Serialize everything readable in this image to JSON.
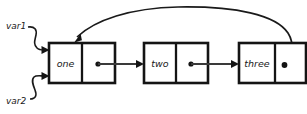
{
  "diagram": {
    "type": "linked-list",
    "background_color": "#ffffff",
    "ink_color": "#141414",
    "nodes": [
      {
        "id": "node-one",
        "label": "one",
        "data_cell": {
          "x": 49,
          "y": 43,
          "width": 33,
          "height": 40
        },
        "pointer_cell": {
          "x": 82,
          "y": 43,
          "width": 33,
          "height": 40
        },
        "pointer_dot": {
          "cx": 98,
          "cy": 64,
          "r": 2.6
        },
        "pointer_target": "node-two"
      },
      {
        "id": "node-two",
        "label": "two",
        "data_cell": {
          "x": 144,
          "y": 43,
          "width": 32,
          "height": 40
        },
        "pointer_cell": {
          "x": 176,
          "y": 43,
          "width": 32,
          "height": 40
        },
        "pointer_dot": {
          "cx": 191,
          "cy": 64,
          "r": 2.6
        },
        "pointer_target": "node-three"
      },
      {
        "id": "node-three",
        "label": "three",
        "data_cell": {
          "x": 239,
          "y": 43,
          "width": 36,
          "height": 40
        },
        "pointer_cell": {
          "x": 275,
          "y": 43,
          "width": 31,
          "height": 40
        },
        "pointer_dot": {
          "cx": 284,
          "cy": 66,
          "r": 2.8
        },
        "pointer_target": "node-one"
      }
    ],
    "variables": [
      {
        "id": "var1",
        "label": "var1",
        "label_x": 6,
        "label_y": 26,
        "points_to": "node-one",
        "arrow_tip": {
          "x": 49,
          "y": 50
        }
      },
      {
        "id": "var2",
        "label": "var2",
        "label_x": 6,
        "label_y": 101,
        "points_to": "node-one",
        "arrow_tip": {
          "x": 49,
          "y": 76
        }
      }
    ],
    "arcs": [
      {
        "id": "tail-to-head-arc",
        "from": "node-three-pointer",
        "to": "node-one-top",
        "arrow_tip": {
          "x": 75,
          "y": 43
        }
      }
    ]
  }
}
